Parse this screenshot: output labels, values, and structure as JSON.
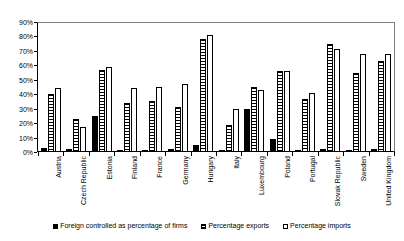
{
  "chart_data": {
    "type": "bar",
    "title": "",
    "xlabel": "",
    "ylabel": "",
    "ylim": [
      0,
      90
    ],
    "ytick_labels": [
      "90%",
      "80%",
      "70%",
      "60%",
      "50%",
      "40%",
      "30%",
      "20%",
      "10%",
      "0%"
    ],
    "ytick_values": [
      90,
      80,
      70,
      60,
      50,
      40,
      30,
      20,
      10,
      0
    ],
    "grid": false,
    "legend_position": "bottom",
    "categories": [
      "Austria",
      "Czech Republic",
      "Estonia",
      "Finland",
      "France",
      "Germany",
      "Hungary",
      "Italy",
      "Luxembourg",
      "Poland",
      "Portugal",
      "Slovak Republic",
      "Sweden",
      "United Kingdom"
    ],
    "series": [
      {
        "name": "Foreign controlled as percentage of firms",
        "fill": "solid-black",
        "values": [
          3,
          2,
          25,
          1,
          1,
          2,
          5,
          1,
          30,
          9,
          1,
          2,
          1,
          2
        ]
      },
      {
        "name": "Percentage exports",
        "fill": "horizontal-hatch",
        "values": [
          40,
          23,
          57,
          34,
          35,
          31,
          78,
          19,
          45,
          56,
          37,
          75,
          55,
          63
        ]
      },
      {
        "name": "Percentage imports",
        "fill": "white",
        "values": [
          44,
          17,
          59,
          44,
          45,
          47,
          81,
          30,
          43,
          56,
          41,
          71,
          68,
          68
        ]
      }
    ]
  },
  "legend": {
    "items": [
      {
        "label": "Foreign controlled as percentage of firms"
      },
      {
        "label": "Percentage exports"
      },
      {
        "label": "Percentage imports"
      }
    ]
  }
}
